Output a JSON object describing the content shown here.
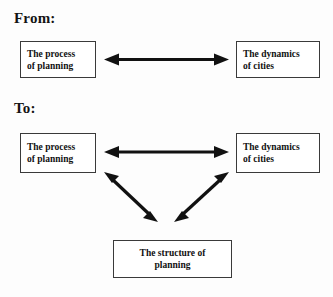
{
  "figure": {
    "title_from": "From:",
    "title_to": "To:"
  },
  "diagram_from": {
    "label": "From:",
    "nodes": [
      {
        "id": "process",
        "text_line1": "The process",
        "text_line2": "of planning",
        "align": "left"
      },
      {
        "id": "dynamics",
        "text_line1": "The dynamics",
        "text_line2": "of cities",
        "align": "left"
      }
    ],
    "connections": [
      {
        "id": "process-dynamics",
        "from": "process",
        "to": "dynamics",
        "style": "double-headed",
        "orientation": "horizontal"
      }
    ]
  },
  "diagram_to": {
    "label": "To:",
    "nodes": [
      {
        "id": "process",
        "text_line1": "The process",
        "text_line2": "of planning",
        "align": "left"
      },
      {
        "id": "dynamics",
        "text_line1": "The dynamics",
        "text_line2": "of cities",
        "align": "left"
      },
      {
        "id": "structure",
        "text_line1": "The structure of",
        "text_line2": "planning",
        "align": "center"
      }
    ],
    "connections": [
      {
        "id": "process-dynamics",
        "from": "process",
        "to": "dynamics",
        "style": "double-headed",
        "orientation": "horizontal"
      },
      {
        "id": "process-structure",
        "from": "process",
        "to": "structure",
        "style": "double-headed",
        "orientation": "diagonal-down-right"
      },
      {
        "id": "structure-dynamics",
        "from": "structure",
        "to": "dynamics",
        "style": "double-headed",
        "orientation": "diagonal-up-right"
      }
    ]
  },
  "colors": {
    "ink": "#111111",
    "box_border": "#3a3a3a",
    "page_background": "#fdfdfd",
    "box_fill": "#ffffff"
  }
}
